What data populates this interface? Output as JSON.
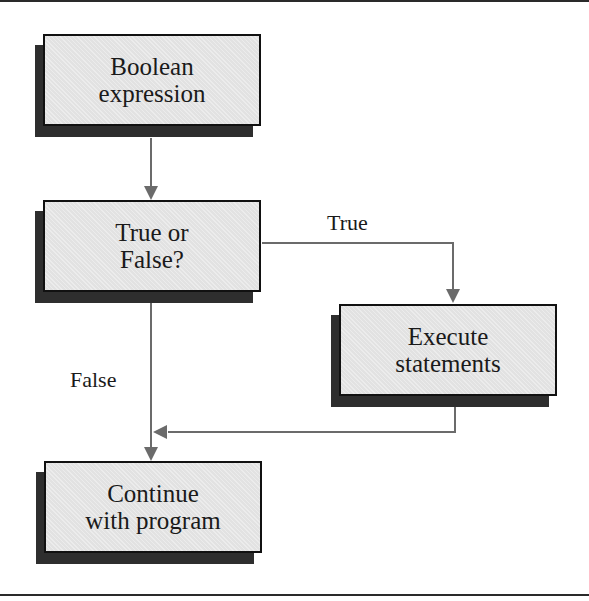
{
  "diagram": {
    "type": "flowchart",
    "nodes": [
      {
        "id": "boolean-expression",
        "lines": [
          "Boolean",
          "expression"
        ]
      },
      {
        "id": "true-or-false",
        "lines": [
          "True or",
          "False?"
        ]
      },
      {
        "id": "execute-statements",
        "lines": [
          "Execute",
          "statements"
        ]
      },
      {
        "id": "continue-with-program",
        "lines": [
          "Continue",
          "with program"
        ]
      }
    ],
    "edges": [
      {
        "from": "boolean-expression",
        "to": "true-or-false",
        "label": ""
      },
      {
        "from": "true-or-false",
        "to": "execute-statements",
        "label": "True"
      },
      {
        "from": "true-or-false",
        "to": "continue-with-program",
        "label": "False"
      },
      {
        "from": "execute-statements",
        "to": "continue-with-program",
        "label": ""
      }
    ],
    "labels": {
      "true_branch": "True",
      "false_branch": "False"
    },
    "colors": {
      "box_fill": "#e2e2e2",
      "box_border": "#111111",
      "shadow": "#2e2e2e",
      "connector": "#6b6b6b",
      "rule": "#2a2a2a"
    }
  }
}
